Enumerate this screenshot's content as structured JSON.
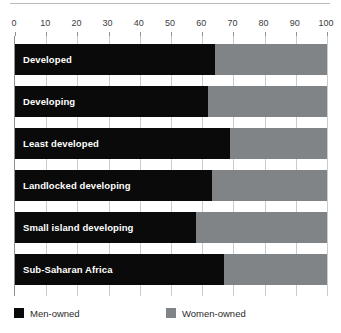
{
  "chart_data": {
    "type": "bar",
    "orientation": "horizontal",
    "stacked": true,
    "stacked_percent": true,
    "title": "",
    "subtitle": "",
    "xlabel": "",
    "ylabel": "",
    "xlim": [
      0,
      100
    ],
    "ylim": null,
    "grid": true,
    "grid_axis": "x",
    "legend_position": "bottom-left",
    "xticks": [
      0,
      10,
      20,
      30,
      40,
      50,
      60,
      70,
      80,
      90,
      100
    ],
    "xtick_labels": [
      "0",
      "10",
      "20",
      "30",
      "40",
      "50",
      "60",
      "70",
      "80",
      "90",
      "100"
    ],
    "categories": [
      "Developed",
      "Developing",
      "Least developed",
      "Landlocked developing",
      "Small island developing",
      "Sub-Saharan Africa"
    ],
    "series": [
      {
        "name": "Men-owned",
        "color": "#0a0a0a",
        "values": [
          64,
          62,
          69,
          63,
          58,
          67
        ]
      },
      {
        "name": "Women-owned",
        "color": "#808487",
        "values": [
          36,
          38,
          31,
          37,
          42,
          33
        ]
      }
    ],
    "annotations": []
  },
  "legend": {
    "items": [
      {
        "label": "Men-owned",
        "color": "#0a0a0a",
        "swatch": "men-swatch"
      },
      {
        "label": "Women-owned",
        "color": "#808487",
        "swatch": "women-swatch"
      }
    ]
  },
  "colors": {
    "men": "#0a0a0a",
    "women": "#808487",
    "gridline": "#c9ccce",
    "axis": "#8e9194",
    "tick_text": "#3c3c3c",
    "bar_label_text": "#ffffff",
    "background": "#ffffff"
  }
}
